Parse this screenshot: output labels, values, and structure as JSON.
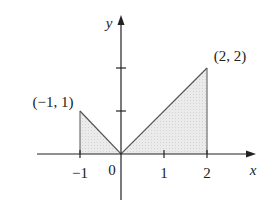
{
  "diagram": {
    "type": "function_graph_shaded_region",
    "axes": {
      "x_label": "x",
      "y_label": "y",
      "x_ticks": [
        "−1",
        "1",
        "2"
      ],
      "origin_label": "0",
      "y_ticks_count": 2
    },
    "points": [
      {
        "label": "(−1, 1)",
        "x": -1,
        "y": 1
      },
      {
        "label": "(2, 2)",
        "x": 2,
        "y": 2
      }
    ],
    "curve": "y = |x|, shaded from x = −1 to x = 2",
    "colors": {
      "fill": "#e6e6e6",
      "stroke": "#444444",
      "axis": "#222222"
    }
  }
}
